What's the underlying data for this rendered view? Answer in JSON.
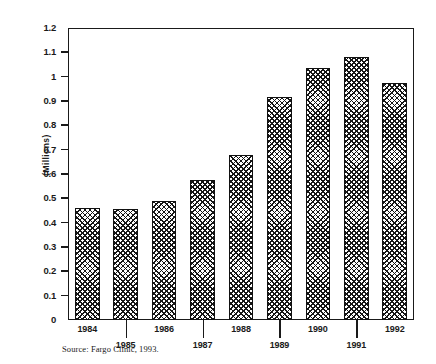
{
  "chart_data": {
    "type": "bar",
    "title": "",
    "subtitle": "",
    "xlabel": "",
    "ylabel": "(Millions)",
    "categories": [
      "1984",
      "1985",
      "1986",
      "1987",
      "1988",
      "1989",
      "1990",
      "1991",
      "1992"
    ],
    "values": [
      0.46,
      0.455,
      0.49,
      0.575,
      0.68,
      0.915,
      1.035,
      1.08,
      0.975
    ],
    "series": [
      {
        "name": "",
        "values": [
          0.46,
          0.455,
          0.49,
          0.575,
          0.68,
          0.915,
          1.035,
          1.08,
          0.975
        ]
      }
    ],
    "ylim": [
      0,
      1.2
    ],
    "ytick_values": [
      0,
      0.1,
      0.2,
      0.3,
      0.4,
      0.5,
      0.6,
      0.7,
      0.8,
      0.9,
      1.0,
      1.1,
      1.2
    ],
    "ytick_labels": [
      "0",
      "0.1",
      "0.2",
      "0.3",
      "0.4",
      "0.5",
      "0.6",
      "0.7",
      "0.8",
      "0.9",
      "1",
      "1.1",
      "1.2"
    ],
    "grid": false,
    "legend": null,
    "bar_fill": "crosshatch-diamond-pattern",
    "bar_color": "#151515",
    "axis_color": "#1a1a1a",
    "background_color": "#ffffff",
    "annotations": [
      "Source:  Fargo Clinic, 1993."
    ]
  },
  "figure": {
    "source_note": "Source:  Fargo Clinic, 1993."
  }
}
